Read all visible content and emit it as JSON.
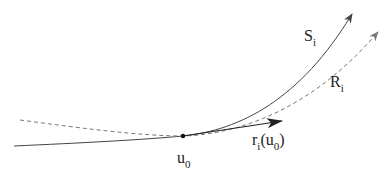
{
  "diagram": {
    "title": "",
    "colors": {
      "solid_curve": "#444444",
      "dashed_curve": "#777777",
      "tangent_arrow": "#222222",
      "point": "#111111",
      "text": "#222222"
    },
    "curves": [
      {
        "id": "S",
        "style": "solid",
        "label_base": "S",
        "label_sub": "i"
      },
      {
        "id": "R",
        "style": "dashed",
        "label_base": "R",
        "label_sub": "i"
      }
    ],
    "point": {
      "label_base": "u",
      "label_sub": "0"
    },
    "tangent": {
      "label_base": "r",
      "label_sub": "i",
      "arg_open": "(u",
      "arg_sub": "0",
      "arg_close": ")"
    }
  }
}
